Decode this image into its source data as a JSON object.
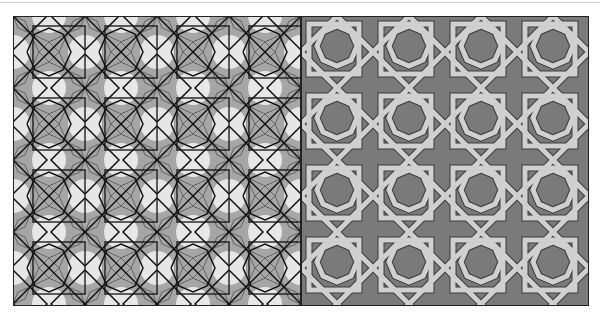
{
  "figure": {
    "panels": [
      {
        "id": "left",
        "description": "girih tile construction with star rosettes and construction lines",
        "background": "#e4e4e4",
        "fill": "#a8a8a8",
        "line": "#111111",
        "tiles_x": 4,
        "tiles_y": 4
      },
      {
        "id": "right",
        "description": "interlaced strapwork pattern",
        "background": "#7a7a7a",
        "band": "#cdcdcd",
        "outline": "#3a3a3a",
        "tiles_x": 4,
        "tiles_y": 4
      }
    ]
  }
}
